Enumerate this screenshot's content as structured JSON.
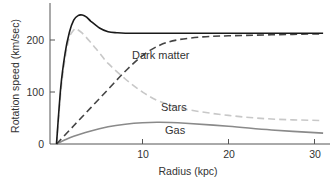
{
  "chart_data": {
    "type": "line",
    "title": "",
    "xlabel": "Radius (kpc)",
    "ylabel": "Rotation speed (km/sec)",
    "xlim": [
      0,
      31
    ],
    "ylim": [
      0,
      265
    ],
    "xticks": [
      10,
      20,
      30
    ],
    "yticks": [
      0,
      100,
      200
    ],
    "grid": false,
    "legend": "inline labels",
    "series": [
      {
        "name": "Total",
        "label": "",
        "style": "solid",
        "color": "#1a1a1a",
        "x": [
          0,
          0.5,
          1,
          1.5,
          2,
          2.5,
          3,
          3.5,
          4,
          5,
          6,
          7,
          8,
          10,
          15,
          20,
          25,
          31
        ],
        "y": [
          0,
          110,
          175,
          215,
          238,
          247,
          248,
          244,
          236,
          223,
          216,
          214,
          213,
          213,
          213,
          213,
          213,
          213
        ]
      },
      {
        "name": "Dark matter",
        "label": "Dark matter",
        "style": "dashed",
        "color": "#444444",
        "x": [
          0,
          2,
          4,
          6,
          8,
          10,
          12,
          14,
          17,
          20,
          25,
          31
        ],
        "y": [
          0,
          35,
          70,
          105,
          140,
          170,
          190,
          200,
          206,
          208,
          210,
          212
        ]
      },
      {
        "name": "Stars",
        "label": "Stars",
        "style": "dashed",
        "color": "#c8c8c8",
        "x": [
          0,
          0.5,
          1,
          1.5,
          2,
          2.3,
          3,
          4,
          5,
          6,
          8,
          10,
          12,
          15,
          20,
          25,
          31
        ],
        "y": [
          0,
          100,
          165,
          205,
          219,
          221,
          213,
          195,
          175,
          155,
          125,
          100,
          82,
          67,
          55,
          48,
          45
        ]
      },
      {
        "name": "Gas",
        "label": "Gas",
        "style": "solid",
        "color": "#8a8a8a",
        "x": [
          0,
          1,
          2,
          4,
          6,
          8,
          10,
          12,
          15,
          20,
          25,
          31
        ],
        "y": [
          0,
          8,
          15,
          25,
          33,
          38,
          41,
          42,
          40,
          34,
          27,
          21
        ]
      }
    ],
    "annotations": [
      {
        "text": "Dark matter",
        "x": 9.4,
        "y": 163
      },
      {
        "text": "Stars",
        "x": 12.3,
        "y": 78
      },
      {
        "text": "Gas",
        "x": 12.5,
        "y": 29
      }
    ]
  },
  "axes": {
    "x_title": "Radius (kpc)",
    "y_title": "Rotation speed (km/sec)",
    "x_tick_labels": [
      "10",
      "20",
      "30"
    ],
    "y_tick_labels": [
      "0",
      "100",
      "200"
    ]
  },
  "labels": {
    "dark_matter": "Dark matter",
    "stars": "Stars",
    "gas": "Gas"
  }
}
